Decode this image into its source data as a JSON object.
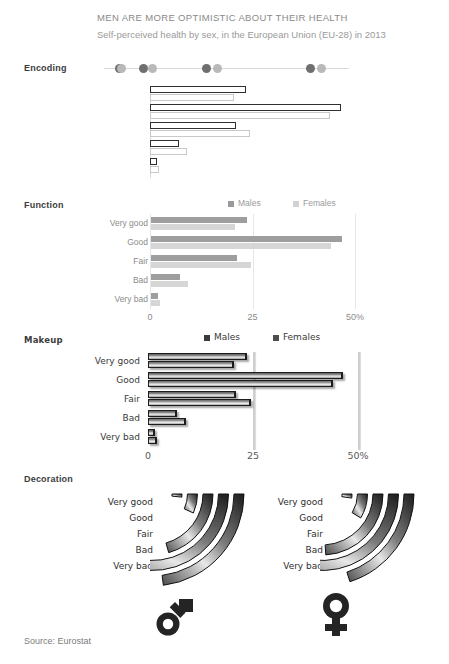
{
  "header": {
    "title": "MEN ARE MORE OPTIMISTIC ABOUT THEIR HEALTH",
    "subtitle": "Self-perceived health by sex, in the European Union (EU-28) in 2013"
  },
  "sections": {
    "encoding": "Encoding",
    "function": "Function",
    "makeup": "Makeup",
    "decoration": "Decoration"
  },
  "legend": {
    "males": "Males",
    "females": "Females"
  },
  "axis": {
    "ticks": [
      "0",
      "25",
      "50%"
    ],
    "tick_values": [
      0,
      25,
      50
    ]
  },
  "source": "Source: Eurostat",
  "icons": {
    "male": "male-gender-symbol",
    "female": "female-gender-symbol"
  },
  "colors": {
    "males": "#9e9e9e",
    "females": "#d6d6d6",
    "males_outline": "#2f2f2f",
    "females_outline": "#c9c9c9",
    "text": "#8b8b8b",
    "title": "#8a8a8a"
  },
  "chart_data": {
    "type": "bar",
    "title": "MEN ARE MORE OPTIMISTIC ABOUT THEIR HEALTH",
    "subtitle": "Self-perceived health by sex, in the European Union (EU-28) in 2013",
    "xlabel": "",
    "ylabel": "",
    "xlim": [
      0,
      50
    ],
    "categories": [
      "Very good",
      "Good",
      "Fair",
      "Bad",
      "Very bad"
    ],
    "series": [
      {
        "name": "Males",
        "values": [
          23.5,
          46.5,
          21.0,
          7.0,
          1.7
        ]
      },
      {
        "name": "Females",
        "values": [
          20.5,
          44.0,
          24.5,
          9.0,
          2.2
        ]
      }
    ],
    "grid": true,
    "legend_position": "top",
    "orientation": "horizontal",
    "note": "Same data shown four times with increasing chart-junk: Encoding (outlined bars only), Function (plain bars + axis), Makeup (3-D beveled bars, comic font), Decoration (curved arc bars + gender symbols)",
    "encoding_dots": [
      {
        "series": "Males",
        "value": 1.7
      },
      {
        "series": "Females",
        "value": 2.2
      },
      {
        "series": "Males",
        "value": 7.0
      },
      {
        "series": "Females",
        "value": 9.0
      },
      {
        "series": "Males",
        "value": 21.0
      },
      {
        "series": "Females",
        "value": 23.5
      },
      {
        "series": "Males",
        "value": 44.0
      },
      {
        "series": "Females",
        "value": 46.5
      }
    ]
  }
}
